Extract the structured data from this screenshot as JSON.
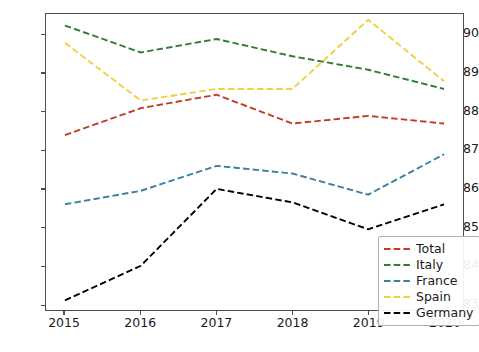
{
  "chart_data": {
    "type": "line",
    "title": "",
    "xlabel": "",
    "ylabel": "",
    "categories": [
      "2015",
      "2016",
      "2017",
      "2018",
      "2019",
      "2020"
    ],
    "x": [
      2015,
      2016,
      2017,
      2018,
      2019,
      2020
    ],
    "xlim": [
      2014.75,
      2020.25
    ],
    "ylim": [
      0.8285,
      0.9055
    ],
    "grid": false,
    "legend_position": "lower right",
    "linestyle": "dashed",
    "yticks": [
      "0.83",
      "0.84",
      "0.85",
      "0.86",
      "0.87",
      "0.88",
      "0.89",
      "0.90"
    ],
    "ytick_values": [
      0.83,
      0.84,
      0.85,
      0.86,
      0.87,
      0.88,
      0.89,
      0.9
    ],
    "xticks": [
      "2015",
      "2016",
      "2017",
      "2018",
      "2019",
      "2020"
    ],
    "series": [
      {
        "name": "Total",
        "color": "#c23b22",
        "values": [
          0.874,
          0.881,
          0.8845,
          0.877,
          0.879,
          0.877
        ]
      },
      {
        "name": "Italy",
        "color": "#2e7d32",
        "values": [
          0.9025,
          0.8955,
          0.899,
          0.8945,
          0.891,
          0.886
        ]
      },
      {
        "name": "France",
        "color": "#3b7ea1",
        "values": [
          0.856,
          0.8595,
          0.866,
          0.864,
          0.8585,
          0.869
        ]
      },
      {
        "name": "Spain",
        "color": "#f2cf45",
        "values": [
          0.898,
          0.883,
          0.886,
          0.886,
          0.904,
          0.888
        ]
      },
      {
        "name": "Germany",
        "color": "#000000",
        "values": [
          0.831,
          0.84,
          0.86,
          0.8565,
          0.8495,
          0.856
        ]
      }
    ]
  },
  "legend": {
    "entries": [
      {
        "label": "Total"
      },
      {
        "label": "Italy"
      },
      {
        "label": "France"
      },
      {
        "label": "Spain"
      },
      {
        "label": "Germany"
      }
    ]
  },
  "axes": {
    "frame_color": "#4d4d4d",
    "tick_color": "#4d4d4d",
    "label_color": "#1a1a1a"
  }
}
